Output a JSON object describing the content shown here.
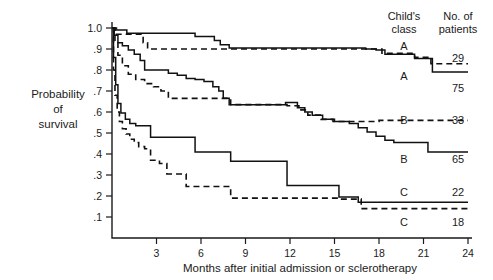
{
  "chart_data": {
    "type": "line",
    "title": "",
    "subtitle": "",
    "xlabel": "Months after initial admission or sclerotherapy",
    "ylabel": "Probability of survival",
    "ylabel_lines": [
      "Probability",
      "of",
      "survival"
    ],
    "xlim": [
      0,
      24
    ],
    "ylim": [
      0,
      1.0
    ],
    "grid": false,
    "legend_position": "right",
    "x_ticks": [
      0,
      3,
      6,
      9,
      12,
      15,
      18,
      21,
      24
    ],
    "x_tick_labels": [
      "",
      "3",
      "6",
      "9",
      "12",
      "15",
      "18",
      "21",
      "24"
    ],
    "y_ticks": [
      0.1,
      0.2,
      0.3,
      0.4,
      0.5,
      0.6,
      0.7,
      0.8,
      0.9,
      1.0
    ],
    "y_tick_labels": [
      ".1",
      ".2",
      ".3",
      ".4",
      ".5",
      ".6",
      ".7",
      ".8",
      ".9",
      "1.0"
    ],
    "legend_headers": {
      "class_line1": "Child's",
      "class_line2": "class",
      "count_line1": "No. of",
      "count_line2": "patients"
    },
    "series": [
      {
        "name": "A-29",
        "child_class": "A",
        "n_patients": "29",
        "style": "dashed",
        "label_class": "A",
        "label_count": "29",
        "steps": [
          [
            0.0,
            1.0
          ],
          [
            0.3,
            0.97
          ],
          [
            1.9,
            0.97
          ],
          [
            2.1,
            0.93
          ],
          [
            2.4,
            0.9
          ],
          [
            6.6,
            0.9
          ],
          [
            16.9,
            0.9
          ],
          [
            17.6,
            0.9
          ],
          [
            18.2,
            0.88
          ],
          [
            19.9,
            0.88
          ],
          [
            20.4,
            0.86
          ],
          [
            21.2,
            0.86
          ],
          [
            21.5,
            0.83
          ],
          [
            24.0,
            0.83
          ]
        ]
      },
      {
        "name": "A-75",
        "child_class": "A",
        "n_patients": "75",
        "style": "solid",
        "label_class": "A",
        "label_count": "75",
        "steps": [
          [
            0.0,
            1.0
          ],
          [
            0.2,
            0.99
          ],
          [
            0.8,
            0.99
          ],
          [
            1.0,
            0.975
          ],
          [
            5.2,
            0.975
          ],
          [
            5.6,
            0.96
          ],
          [
            6.6,
            0.96
          ],
          [
            6.9,
            0.94
          ],
          [
            7.3,
            0.92
          ],
          [
            7.9,
            0.905
          ],
          [
            16.6,
            0.905
          ],
          [
            17.1,
            0.9
          ],
          [
            17.8,
            0.895
          ],
          [
            18.4,
            0.875
          ],
          [
            20.0,
            0.875
          ],
          [
            20.4,
            0.855
          ],
          [
            21.2,
            0.855
          ],
          [
            21.6,
            0.79
          ],
          [
            24.0,
            0.79
          ]
        ]
      },
      {
        "name": "B-33",
        "child_class": "B",
        "n_patients": "33",
        "style": "dashed",
        "label_class": "B",
        "label_count": "33",
        "steps": [
          [
            0.0,
            1.0
          ],
          [
            0.2,
            0.93
          ],
          [
            0.4,
            0.87
          ],
          [
            0.7,
            0.82
          ],
          [
            1.1,
            0.78
          ],
          [
            1.6,
            0.755
          ],
          [
            2.2,
            0.735
          ],
          [
            2.8,
            0.72
          ],
          [
            3.3,
            0.7
          ],
          [
            3.8,
            0.665
          ],
          [
            7.6,
            0.665
          ],
          [
            8.0,
            0.635
          ],
          [
            11.4,
            0.635
          ],
          [
            11.8,
            0.63
          ],
          [
            12.6,
            0.61
          ],
          [
            13.2,
            0.585
          ],
          [
            14.1,
            0.565
          ],
          [
            14.9,
            0.555
          ],
          [
            17.5,
            0.555
          ],
          [
            18.0,
            0.56
          ],
          [
            24.0,
            0.56
          ]
        ]
      },
      {
        "name": "B-65",
        "child_class": "B",
        "n_patients": "65",
        "style": "solid",
        "label_class": "B",
        "label_count": "65",
        "steps": [
          [
            0.0,
            1.0
          ],
          [
            0.15,
            0.965
          ],
          [
            0.4,
            0.93
          ],
          [
            0.7,
            0.915
          ],
          [
            1.1,
            0.895
          ],
          [
            1.5,
            0.875
          ],
          [
            1.9,
            0.845
          ],
          [
            2.2,
            0.8
          ],
          [
            3.4,
            0.8
          ],
          [
            3.8,
            0.785
          ],
          [
            4.4,
            0.775
          ],
          [
            5.0,
            0.76
          ],
          [
            5.6,
            0.755
          ],
          [
            6.2,
            0.745
          ],
          [
            6.8,
            0.72
          ],
          [
            7.2,
            0.7
          ],
          [
            7.5,
            0.665
          ],
          [
            7.9,
            0.635
          ],
          [
            11.3,
            0.635
          ],
          [
            11.7,
            0.645
          ],
          [
            12.2,
            0.645
          ],
          [
            12.5,
            0.62
          ],
          [
            13.0,
            0.6
          ],
          [
            13.5,
            0.585
          ],
          [
            14.2,
            0.565
          ],
          [
            15.0,
            0.555
          ],
          [
            16.0,
            0.545
          ],
          [
            16.6,
            0.525
          ],
          [
            17.2,
            0.505
          ],
          [
            17.8,
            0.485
          ],
          [
            18.4,
            0.465
          ],
          [
            19.0,
            0.455
          ],
          [
            20.8,
            0.455
          ],
          [
            21.3,
            0.41
          ],
          [
            24.0,
            0.41
          ]
        ]
      },
      {
        "name": "C-22",
        "child_class": "C",
        "n_patients": "22",
        "style": "solid",
        "label_class": "C",
        "label_count": "22",
        "steps": [
          [
            0.0,
            1.0
          ],
          [
            0.1,
            0.86
          ],
          [
            0.25,
            0.73
          ],
          [
            0.4,
            0.64
          ],
          [
            0.6,
            0.595
          ],
          [
            0.9,
            0.565
          ],
          [
            1.2,
            0.545
          ],
          [
            1.6,
            0.535
          ],
          [
            2.2,
            0.535
          ],
          [
            2.6,
            0.48
          ],
          [
            5.2,
            0.48
          ],
          [
            5.6,
            0.41
          ],
          [
            7.6,
            0.41
          ],
          [
            8.0,
            0.365
          ],
          [
            11.4,
            0.365
          ],
          [
            11.8,
            0.25
          ],
          [
            15.0,
            0.25
          ],
          [
            15.3,
            0.195
          ],
          [
            16.2,
            0.195
          ],
          [
            16.6,
            0.17
          ],
          [
            24.0,
            0.17
          ]
        ]
      },
      {
        "name": "C-18",
        "child_class": "C",
        "n_patients": "18",
        "style": "dashed",
        "label_class": "C",
        "label_count": "18",
        "steps": [
          [
            0.0,
            1.0
          ],
          [
            0.1,
            0.8
          ],
          [
            0.2,
            0.68
          ],
          [
            0.35,
            0.6
          ],
          [
            0.5,
            0.555
          ],
          [
            0.7,
            0.52
          ],
          [
            0.95,
            0.495
          ],
          [
            1.2,
            0.47
          ],
          [
            1.5,
            0.455
          ],
          [
            1.8,
            0.435
          ],
          [
            2.2,
            0.425
          ],
          [
            2.6,
            0.37
          ],
          [
            3.2,
            0.355
          ],
          [
            3.7,
            0.305
          ],
          [
            4.6,
            0.305
          ],
          [
            5.0,
            0.245
          ],
          [
            7.6,
            0.245
          ],
          [
            8.0,
            0.19
          ],
          [
            15.0,
            0.19
          ],
          [
            15.4,
            0.185
          ],
          [
            16.3,
            0.185
          ],
          [
            16.8,
            0.14
          ],
          [
            24.0,
            0.14
          ]
        ]
      }
    ],
    "legend_entries": [
      {
        "child_class": "A",
        "n_patients": "29",
        "style": "dashed"
      },
      {
        "child_class": "A",
        "n_patients": "75",
        "style": "solid"
      },
      {
        "child_class": "B",
        "n_patients": "33",
        "style": "dashed"
      },
      {
        "child_class": "B",
        "n_patients": "65",
        "style": "solid"
      },
      {
        "child_class": "C",
        "n_patients": "22",
        "style": "solid"
      },
      {
        "child_class": "C",
        "n_patients": "18",
        "style": "dashed"
      }
    ],
    "colors": {
      "line": "#111111",
      "axis": "#1a1a1a",
      "background": "#ffffff"
    }
  }
}
